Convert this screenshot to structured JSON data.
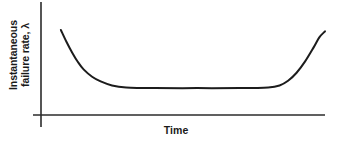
{
  "chart_data": {
    "type": "line",
    "title": "",
    "subtitle": "",
    "xlabel": "Time",
    "ylabel_line1": "Instantaneous",
    "ylabel_line2": "failure rate, λ",
    "ylabel": "Instantaneous failure rate, λ",
    "legend": [],
    "legend_position": "none",
    "grid": false,
    "xlim": [
      0,
      1
    ],
    "ylim": [
      0,
      1
    ],
    "xticks": [],
    "yticks": [],
    "xtick_labels": [],
    "ytick_labels": [],
    "annotations": [],
    "series": [
      {
        "name": "Bathtub curve (instantaneous failure rate)",
        "description": "Classic reliability bathtub curve: high decreasing infant-mortality failure rate, long flat constant-rate useful-life region, then sharply increasing wear-out failure rate.",
        "x": [
          0.07,
          0.09,
          0.11,
          0.13,
          0.15,
          0.18,
          0.21,
          0.25,
          0.3,
          0.4,
          0.55,
          0.7,
          0.8,
          0.84,
          0.87,
          0.9,
          0.93,
          0.96,
          0.98,
          1.0
        ],
        "y": [
          1.0,
          0.82,
          0.66,
          0.52,
          0.41,
          0.3,
          0.23,
          0.17,
          0.14,
          0.13,
          0.13,
          0.13,
          0.14,
          0.17,
          0.24,
          0.36,
          0.53,
          0.74,
          0.89,
          0.98
        ]
      }
    ],
    "regions": [
      {
        "name": "infant-mortality",
        "trend": "decreasing"
      },
      {
        "name": "useful-life",
        "trend": "constant"
      },
      {
        "name": "wear-out",
        "trend": "increasing"
      }
    ],
    "colors": {
      "curve": "#1c1c1c",
      "axis": "#2b2b2b",
      "background": "#ffffff",
      "text": "#1a1a1a"
    }
  }
}
